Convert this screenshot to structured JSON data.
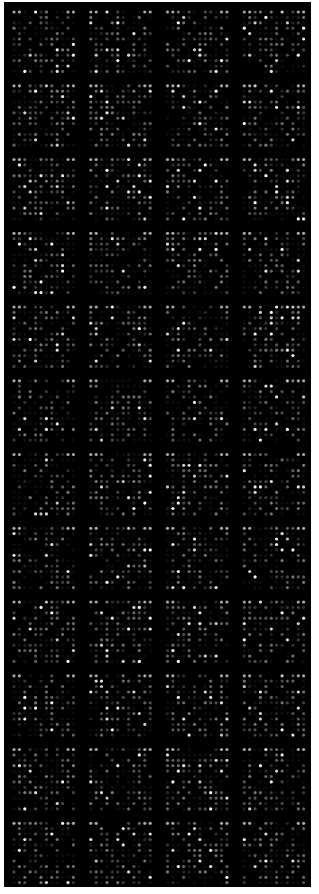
{
  "image": {
    "kind": "microarray-fluorescence-scan",
    "background_color": "#000000",
    "margin_color": "#ffffff",
    "spot_color": "#ffffff"
  },
  "array": {
    "block_columns": 4,
    "block_rows": 12,
    "spots_per_block_columns": 12,
    "spots_per_block_rows": 12,
    "corner_marker_pairs": true,
    "random_seed": 7,
    "bright_spot_fraction": 0.06,
    "dim_spot_fraction": 0.35
  }
}
